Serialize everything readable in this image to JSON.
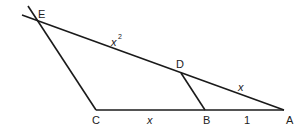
{
  "diagram": {
    "points": {
      "E": {
        "label": "E",
        "x": 36,
        "y": 20
      },
      "D": {
        "label": "D",
        "x": 181,
        "y": 73
      },
      "C": {
        "label": "C",
        "x": 96,
        "y": 110
      },
      "B": {
        "label": "B",
        "x": 205,
        "y": 110
      },
      "A": {
        "label": "A",
        "x": 284,
        "y": 110
      }
    },
    "segment_labels": {
      "ED": "x",
      "ED_exp": "2",
      "DA": "x",
      "CB": "x",
      "BA": "1"
    },
    "colors": {
      "stroke": "#1a1a1a",
      "text": "#222222",
      "background": "#ffffff"
    }
  }
}
